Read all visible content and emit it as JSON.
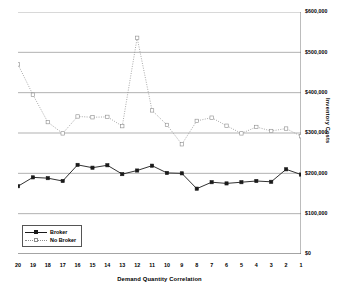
{
  "chart_data": {
    "type": "line",
    "title": "",
    "xlabel": "Demand Quantity Correlation",
    "ylabel": "Inventory Costs",
    "categories": [
      "20",
      "19",
      "18",
      "17",
      "16",
      "15",
      "14",
      "13",
      "12",
      "11",
      "10",
      "9",
      "8",
      "7",
      "6",
      "5",
      "4",
      "3",
      "2",
      "1"
    ],
    "ylim": [
      0,
      600000
    ],
    "ytick_values": [
      0,
      100000,
      200000,
      300000,
      400000,
      500000,
      600000
    ],
    "ytick_labels": [
      "$0",
      "$100,000",
      "$200,000",
      "$300,000",
      "$400,000",
      "$500,000",
      "$600,000"
    ],
    "grid": "horizontal",
    "legend_position": "lower-left-inside",
    "series": [
      {
        "name": "Broker",
        "style": "solid",
        "marker": "filled-square",
        "color": "#1a1a1a",
        "values": [
          168000,
          190000,
          188000,
          181000,
          221000,
          214000,
          220000,
          198000,
          207000,
          219000,
          201000,
          200000,
          162000,
          178000,
          175000,
          178000,
          181000,
          179000,
          210000,
          197000
        ]
      },
      {
        "name": "No Broker",
        "style": "dotted",
        "marker": "open-square",
        "color": "#8c8c8c",
        "values": [
          470000,
          395000,
          327000,
          299000,
          341000,
          339000,
          340000,
          317000,
          536000,
          356000,
          320000,
          272000,
          330000,
          338000,
          318000,
          299000,
          315000,
          305000,
          311000,
          292000
        ]
      }
    ]
  },
  "legend": {
    "items": [
      {
        "label": "Broker"
      },
      {
        "label": "No Broker"
      }
    ]
  }
}
